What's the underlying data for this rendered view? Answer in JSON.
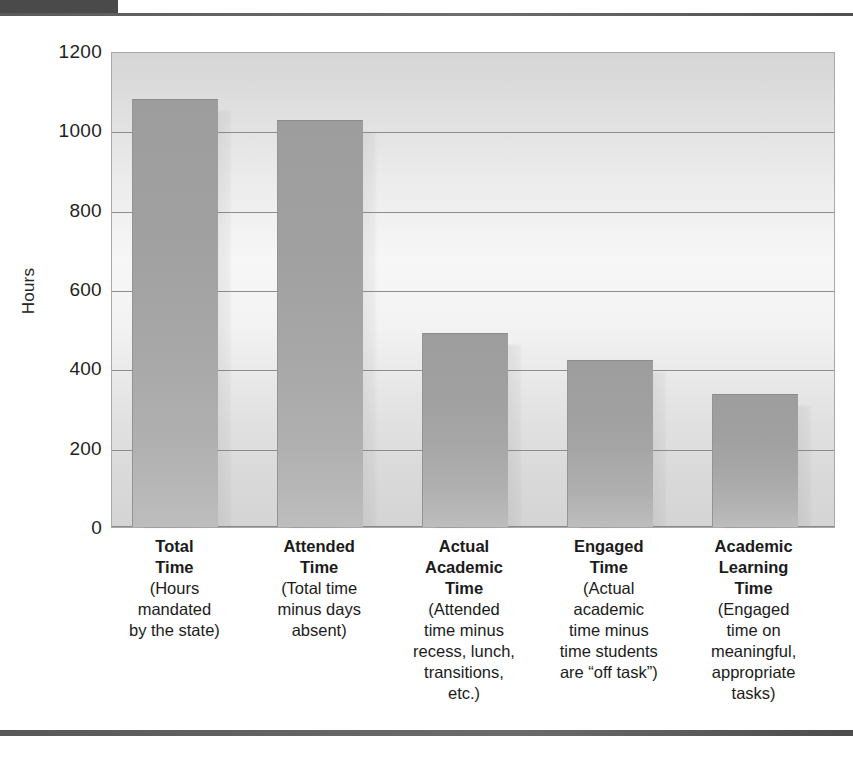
{
  "header": {
    "tab_label": "",
    "caption": "",
    "footer_rule": ""
  },
  "chart_data": {
    "type": "bar",
    "title": "",
    "xlabel": "",
    "ylabel": "Hours",
    "ylim": [
      0,
      1200
    ],
    "ytick_step": 200,
    "yticks": [
      "1200",
      "1000",
      "800",
      "600",
      "400",
      "200",
      "0"
    ],
    "ytick_values": [
      1200,
      1000,
      800,
      600,
      400,
      200,
      0
    ],
    "grid": true,
    "legend": "none",
    "bar_color": "#a4a4a4",
    "plot_bg": "#eaeaea",
    "categories": [
      "Total Time",
      "Attended Time",
      "Actual Academic Time",
      "Engaged Time",
      "Academic Learning Time"
    ],
    "values": [
      1080,
      1025,
      490,
      420,
      335
    ],
    "category_labels": [
      {
        "name": "Total\nTime",
        "desc": "(Hours\nmandated\nby the state)"
      },
      {
        "name": "Attended\nTime",
        "desc": "(Total time\nminus days\nabsent)"
      },
      {
        "name": "Actual\nAcademic\nTime",
        "desc": "(Attended\ntime minus\nrecess, lunch,\ntransitions,\netc.)"
      },
      {
        "name": "Engaged\nTime",
        "desc": "(Actual\nacademic\ntime minus\ntime students\nare “off task”)"
      },
      {
        "name": "Academic\nLearning\nTime",
        "desc": "(Engaged\ntime on\nmeaningful,\nappropriate\ntasks)"
      }
    ]
  }
}
